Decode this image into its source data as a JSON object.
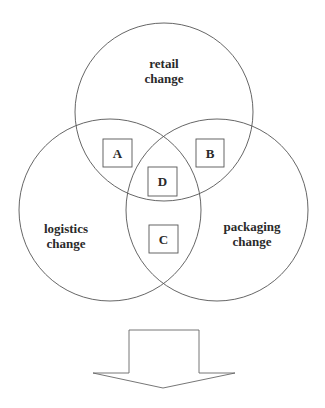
{
  "diagram": {
    "type": "venn",
    "circles": [
      {
        "id": "retail",
        "line1": "retail",
        "line2": "change"
      },
      {
        "id": "logistics",
        "line1": "logistics",
        "line2": "change"
      },
      {
        "id": "packaging",
        "line1": "packaging",
        "line2": "change"
      }
    ],
    "regions": [
      {
        "id": "A",
        "label": "A",
        "between": [
          "retail",
          "logistics"
        ]
      },
      {
        "id": "B",
        "label": "B",
        "between": [
          "retail",
          "packaging"
        ]
      },
      {
        "id": "C",
        "label": "C",
        "between": [
          "logistics",
          "packaging"
        ]
      },
      {
        "id": "D",
        "label": "D",
        "between": [
          "retail",
          "logistics",
          "packaging"
        ]
      }
    ],
    "arrow": {
      "direction": "down"
    }
  }
}
